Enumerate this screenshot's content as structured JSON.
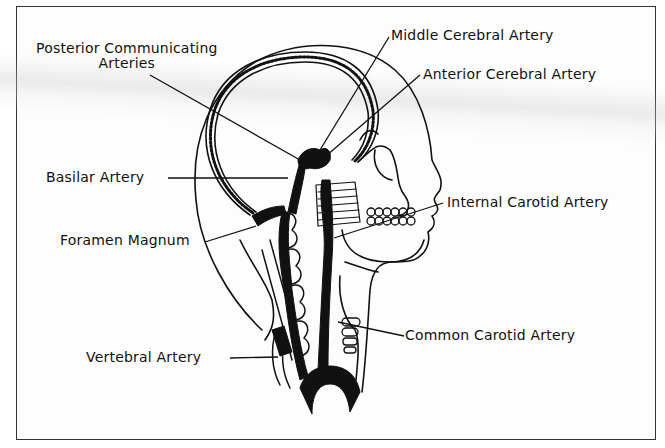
{
  "diagram": {
    "colors": {
      "ink": "#111111",
      "frame": "#333333",
      "paper": "#fdfdfd"
    },
    "labels": {
      "posterior_communicating_line1": "Posterior Communicating",
      "posterior_communicating_line2": "Arteries",
      "middle_cerebral": "Middle Cerebral Artery",
      "anterior_cerebral": "Anterior Cerebral Artery",
      "basilar": "Basilar Artery",
      "internal_carotid": "Internal Carotid Artery",
      "foramen_magnum": "Foramen Magnum",
      "common_carotid": "Common Carotid Artery",
      "vertebral": "Vertebral Artery"
    }
  }
}
